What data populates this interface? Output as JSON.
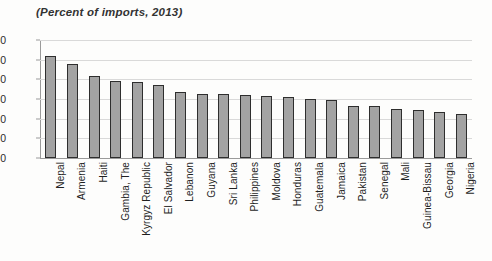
{
  "chart_data": {
    "type": "bar",
    "title": "(Percent of imports, 2013)",
    "xlabel": "",
    "ylabel": "",
    "ylim": [
      0,
      60
    ],
    "yticks": [
      0,
      10,
      20,
      30,
      40,
      50,
      60
    ],
    "grid": true,
    "legend": false,
    "bar_color": "#a3a3a3",
    "bar_border_color": "#2e2e2e",
    "categories": [
      "Nepal",
      "Armenia",
      "Haiti",
      "Gambia, The",
      "Kyrgyz Republic",
      "El Salvador",
      "Lebanon",
      "Guyana",
      "Sri Lanka",
      "Philippines",
      "Moldova",
      "Honduras",
      "Guatemala",
      "Jamaica",
      "Pakistan",
      "Senegal",
      "Mali",
      "Guinea-Bissau",
      "Georgia",
      "Nigeria"
    ],
    "values": [
      51.8,
      47.7,
      41.5,
      39.2,
      38.5,
      37.2,
      33.4,
      32.8,
      32.3,
      32.0,
      31.6,
      31.2,
      30.0,
      29.4,
      26.7,
      26.5,
      24.7,
      24.3,
      23.3,
      22.2
    ]
  }
}
